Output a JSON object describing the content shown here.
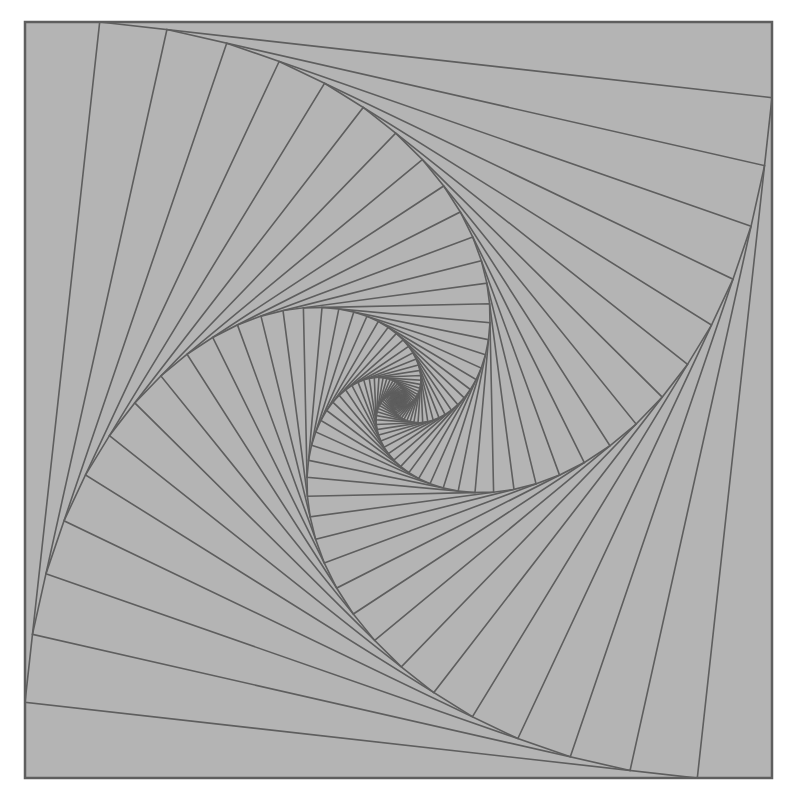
{
  "figure": {
    "type": "nested-squares-whirl",
    "background_color": "#b4b4b4",
    "line_color": "#5e5e5e",
    "page_color": "#ffffff",
    "outer_square": {
      "corners": [
        [
          25,
          22
        ],
        [
          772,
          22
        ],
        [
          772,
          778
        ],
        [
          25,
          778
        ]
      ]
    },
    "step_fraction": 0.1,
    "iterations": 60,
    "line_width": 1.6
  }
}
